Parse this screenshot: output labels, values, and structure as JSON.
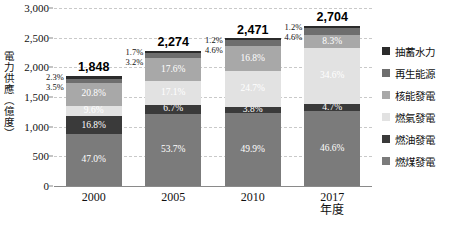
{
  "chart_data": {
    "type": "bar",
    "title": "",
    "xlabel": "",
    "ylabel": "電力供應（億度）",
    "ylim": [
      0,
      3000
    ],
    "yticks": [
      "0",
      "500",
      "1,000",
      "1,500",
      "2,000",
      "2,500",
      "3,000"
    ],
    "grid": true,
    "legend_position": "right",
    "categories": [
      "2000",
      "2005",
      "2010",
      "2017\n年度"
    ],
    "category_labels": [
      {
        "line1": "2000",
        "line2": ""
      },
      {
        "line1": "2005",
        "line2": ""
      },
      {
        "line1": "2010",
        "line2": ""
      },
      {
        "line1": "2017",
        "line2": "年度"
      }
    ],
    "totals": [
      "1,848",
      "2,274",
      "2,471",
      "2,704"
    ],
    "total_values": [
      1848,
      2274,
      2471,
      2704
    ],
    "stack_order_bottom_to_top": [
      "燃煤發電",
      "燃油發電",
      "燃氣發電",
      "核能發電",
      "再生能源",
      "抽蓄水力"
    ],
    "series": [
      {
        "name": "燃煤發電",
        "color": "#7b7b7b",
        "label_color": "#ffffff",
        "values": [
          47.0,
          53.7,
          49.9,
          46.6
        ],
        "labels": [
          "47.0%",
          "53.7%",
          "49.9%",
          "46.6%"
        ]
      },
      {
        "name": "燃油發電",
        "color": "#3a3a3a",
        "label_color": "#ffffff",
        "values": [
          16.8,
          6.7,
          3.8,
          4.7
        ],
        "labels": [
          "16.8%",
          "6.7%",
          "3.8%",
          "4.7%"
        ]
      },
      {
        "name": "燃氣發電",
        "color": "#e2e2e2",
        "label_color": "#ffffff",
        "values": [
          9.6,
          17.1,
          24.7,
          34.6
        ],
        "labels": [
          "9.6%",
          "17.1%",
          "24.7%",
          "34.6%"
        ]
      },
      {
        "name": "核能發電",
        "color": "#a8a8a8",
        "label_color": "#ffffff",
        "values": [
          20.8,
          17.6,
          16.8,
          8.3
        ],
        "labels": [
          "20.8%",
          "17.6%",
          "16.8%",
          "8.3%"
        ]
      },
      {
        "name": "再生能源",
        "color": "#6e6e6e",
        "label_color": "#ffffff",
        "values": [
          3.5,
          3.2,
          4.6,
          4.6
        ],
        "labels": [
          "",
          "",
          "",
          ""
        ]
      },
      {
        "name": "抽蓄水力",
        "color": "#2b2b2b",
        "label_color": "#ffffff",
        "values": [
          2.3,
          1.7,
          1.2,
          1.2
        ],
        "labels": [
          "",
          "",
          "",
          ""
        ]
      }
    ],
    "callouts": [
      {
        "category": "2000",
        "upper": "2.3%",
        "lower": "3.5%"
      },
      {
        "category": "2005",
        "upper": "1.7%",
        "lower": "3.2%"
      },
      {
        "category": "2010",
        "upper": "1.2%",
        "lower": "4.6%"
      },
      {
        "category": "2017",
        "upper": "1.2%",
        "lower": "4.6%"
      }
    ]
  },
  "legend": {
    "items": [
      {
        "label": "抽蓄水力",
        "color": "#2b2b2b"
      },
      {
        "label": "再生能源",
        "color": "#6e6e6e"
      },
      {
        "label": "核能發電",
        "color": "#a8a8a8"
      },
      {
        "label": "燃氣發電",
        "color": "#e2e2e2"
      },
      {
        "label": "燃油發電",
        "color": "#3a3a3a"
      },
      {
        "label": "燃煤發電",
        "color": "#7b7b7b"
      }
    ]
  }
}
